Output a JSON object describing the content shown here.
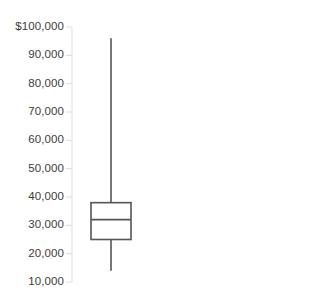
{
  "chart_data": {
    "type": "box",
    "title": "",
    "xlabel": "",
    "ylabel": "",
    "grid": false,
    "legend": "none",
    "axis": {
      "position": "left",
      "min": 10000,
      "max": 100000,
      "tick_step": 10000,
      "tick_labels": [
        "$100,000",
        "90,000",
        "80,000",
        "70,000",
        "60,000",
        "50,000",
        "40,000",
        "30,000",
        "20,000",
        "10,000"
      ],
      "tick_values": [
        100000,
        90000,
        80000,
        70000,
        60000,
        50000,
        40000,
        30000,
        20000,
        10000
      ]
    },
    "categories": [
      "Series 1"
    ],
    "boxes": [
      {
        "name": "Series 1",
        "whisker_high": 96000,
        "q3": 38000,
        "median": 32000,
        "q1": 25000,
        "whisker_low": 14000,
        "outliers": []
      }
    ],
    "colors": {
      "box_stroke": "#555555",
      "median_stroke": "#555555",
      "whisker_stroke": "#555555",
      "box_fill": "#ffffff",
      "axis_line": "#dddddd",
      "tick_mark": "#dddddd",
      "tick_text": "#3c3c3c",
      "background": "#ffffff"
    }
  },
  "geometry": {
    "axis_x": 72,
    "axis_top": 27,
    "axis_bottom": 282,
    "tick_mark_length": 6,
    "box_left": 91,
    "box_right": 131,
    "center_x": 111,
    "label_right_edge": 64,
    "tick_y": [
      27,
      55.3,
      83.7,
      112,
      140.3,
      168.7,
      197,
      225.3,
      253.7,
      282
    ],
    "box_top_y": 200.3,
    "median_y": 220.2,
    "box_bottom_y": 240.8,
    "whisker_high_y": 33.3,
    "whisker_low_y": 268.7
  }
}
